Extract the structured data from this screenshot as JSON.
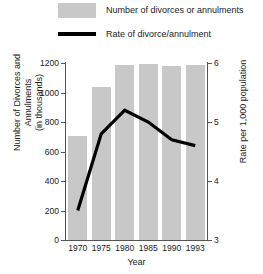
{
  "legend": {
    "items": [
      {
        "label": "Number of divorces or annulments",
        "marker": "bar-swatch",
        "color": "#c8c8c8"
      },
      {
        "label": "Rate of divorce/annulment",
        "marker": "line-swatch",
        "color": "#000000"
      }
    ]
  },
  "axes": {
    "left": {
      "title_line1": "Number of Divorces and Annulments",
      "title_line2": "(in thousands)",
      "ticks": [
        "0",
        "200",
        "400",
        "600",
        "800",
        "1000",
        "1200"
      ],
      "min": 0,
      "max": 1200
    },
    "right": {
      "title": "Rate per 1,000 population",
      "ticks": [
        "3",
        "4",
        "5",
        "6"
      ],
      "min": 3,
      "max": 6
    },
    "x": {
      "title": "Year",
      "ticks": [
        "1970",
        "1975",
        "1980",
        "1985",
        "1990",
        "1993"
      ]
    }
  },
  "chart_data": {
    "type": "bar",
    "title": "",
    "subtitle": "",
    "xlabel": "Year",
    "ylabel": "Number of Divorces and Annulments (in thousands)",
    "y2label": "Rate per 1,000 population",
    "categories": [
      "1970",
      "1975",
      "1980",
      "1985",
      "1990",
      "1993"
    ],
    "ylim": [
      0,
      1200
    ],
    "y2lim": [
      3,
      6
    ],
    "grid": false,
    "legend_position": "top-left",
    "series": [
      {
        "name": "Number of divorces or annulments",
        "type": "bar",
        "axis": "left",
        "units": "thousands",
        "color": "#c8c8c8",
        "values": [
          708,
          1036,
          1189,
          1190,
          1182,
          1187
        ]
      },
      {
        "name": "Rate of divorce/annulment",
        "type": "line",
        "axis": "right",
        "units": "per 1,000 population",
        "color": "#000000",
        "values": [
          3.5,
          4.8,
          5.2,
          5.0,
          4.7,
          4.6
        ]
      }
    ]
  }
}
